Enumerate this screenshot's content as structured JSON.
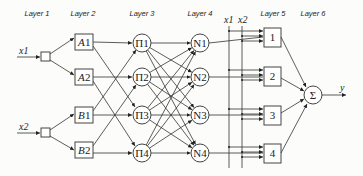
{
  "layers": [
    {
      "label": "Layer 1",
      "x": 37
    },
    {
      "label": "Layer 2",
      "x": 83
    },
    {
      "label": "Layer 3",
      "x": 142
    },
    {
      "label": "Layer 4",
      "x": 200
    },
    {
      "label": "Layer 5",
      "x": 272
    },
    {
      "label": "Layer 6",
      "x": 313
    }
  ],
  "inputs": [
    {
      "label": "x1",
      "y": 57
    },
    {
      "label": "x2",
      "y": 133
    }
  ],
  "membership_nodes": [
    {
      "letter": "A",
      "index": "1",
      "y": 42
    },
    {
      "letter": "A",
      "index": "2",
      "y": 77
    },
    {
      "letter": "B",
      "index": "1",
      "y": 115
    },
    {
      "letter": "B",
      "index": "2",
      "y": 150
    }
  ],
  "product_nodes": [
    {
      "label": "Π1",
      "y": 43
    },
    {
      "label": "Π2",
      "y": 77
    },
    {
      "label": "Π3",
      "y": 115
    },
    {
      "label": "Π4",
      "y": 153
    }
  ],
  "norm_nodes": [
    {
      "label": "N1",
      "y": 43
    },
    {
      "label": "N2",
      "y": 77
    },
    {
      "label": "N3",
      "y": 115
    },
    {
      "label": "N4",
      "y": 153
    }
  ],
  "bus_labels": {
    "x1": "x1",
    "x2": "x2"
  },
  "consequent_nodes": [
    {
      "label": "1",
      "y": 37
    },
    {
      "label": "2",
      "y": 76
    },
    {
      "label": "3",
      "y": 115
    },
    {
      "label": "4",
      "y": 153
    }
  ],
  "sum_node": {
    "label": "Σ",
    "y": 95
  },
  "output": {
    "label": "y"
  }
}
